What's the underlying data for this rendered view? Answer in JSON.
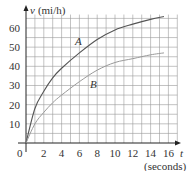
{
  "chart_data": {
    "type": "line",
    "title": "",
    "xlabel": "t",
    "xlabel_units": "(seconds)",
    "ylabel": "v",
    "ylabel_units": "(mi/h)",
    "xlim": [
      0,
      17
    ],
    "ylim": [
      0,
      67
    ],
    "x_ticks": [
      0,
      2,
      4,
      6,
      8,
      10,
      12,
      14,
      16
    ],
    "y_ticks": [
      10,
      20,
      30,
      40,
      50,
      60
    ],
    "grid": true,
    "grid_minor_step_x": 1,
    "grid_minor_step_y": 5,
    "series": [
      {
        "name": "A",
        "x": [
          0,
          1,
          2,
          3,
          4,
          6,
          8,
          10,
          12,
          14,
          15.5
        ],
        "values": [
          0,
          18,
          27,
          34,
          39,
          47,
          54,
          59,
          62,
          64.5,
          66
        ]
      },
      {
        "name": "B",
        "x": [
          0,
          1,
          2,
          3,
          4,
          6,
          8,
          10,
          12,
          14,
          15.5
        ],
        "values": [
          0,
          10,
          16,
          21,
          25,
          32,
          38,
          42,
          44,
          46,
          47
        ]
      }
    ]
  },
  "labels": {
    "y_axis": "v",
    "y_units": "(mi/h)",
    "x_axis": "t",
    "x_units": "(seconds)",
    "origin": "0",
    "series_a": "A",
    "series_b": "B"
  }
}
